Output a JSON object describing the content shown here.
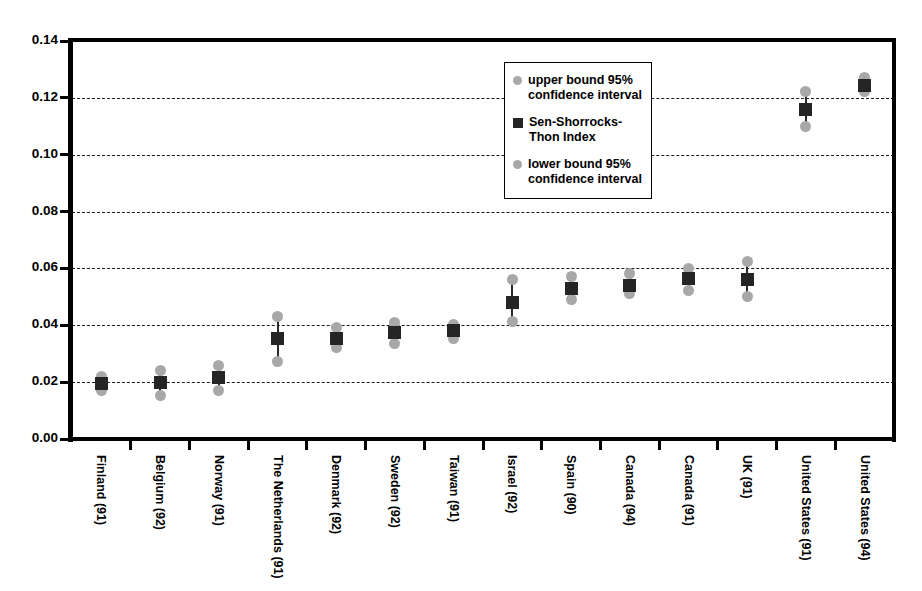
{
  "chart_data": {
    "type": "scatter",
    "title": "",
    "subtitle": "",
    "xlabel": "",
    "ylabel": "",
    "ylim": [
      0.0,
      0.14
    ],
    "ytick_labels": [
      "0.00",
      "0.02",
      "0.04",
      "0.06",
      "0.08",
      "0.10",
      "0.12",
      "0.14"
    ],
    "ytick_values": [
      0.0,
      0.02,
      0.04,
      0.06,
      0.08,
      0.1,
      0.12,
      0.14
    ],
    "grid": true,
    "grid_style": "dashed-horizontal",
    "legend_position": "inside-upper-center",
    "categories": [
      "Finland (91)",
      "Belgium (92)",
      "Norway (91)",
      "The Netherlands (91)",
      "Denmark (92)",
      "Sweden (92)",
      "Taiwan (91)",
      "Israel (92)",
      "Spain (90)",
      "Canada (94)",
      "Canada (91)",
      "UK (91)",
      "United States (91)",
      "United States (94)"
    ],
    "series": [
      {
        "name": "upper bound 95% confidence interval",
        "marker": "circle",
        "color": "#a8a8a8",
        "values": [
          0.022,
          0.024,
          0.026,
          0.0432,
          0.0392,
          0.041,
          0.0402,
          0.056,
          0.0572,
          0.0582,
          0.06,
          0.0625,
          0.1222,
          0.1272
        ]
      },
      {
        "name": "Sen-Shorrocks-Thon Index",
        "marker": "square",
        "color": "#252525",
        "values": [
          0.0195,
          0.0197,
          0.0215,
          0.0355,
          0.0355,
          0.0375,
          0.038,
          0.048,
          0.0528,
          0.054,
          0.0565,
          0.056,
          0.116,
          0.1245
        ]
      },
      {
        "name": "lower bound 95% confidence interval",
        "marker": "circle",
        "color": "#a8a8a8",
        "values": [
          0.0172,
          0.0152,
          0.017,
          0.0272,
          0.0322,
          0.0335,
          0.0352,
          0.0412,
          0.049,
          0.0512,
          0.0522,
          0.05,
          0.11,
          0.1222
        ]
      }
    ]
  },
  "legend": {
    "items": [
      {
        "label": "upper bound 95% confidence interval",
        "marker": "circle",
        "color": "#a8a8a8"
      },
      {
        "label": "Sen-Shorrocks-Thon Index",
        "marker": "square",
        "color": "#252525"
      },
      {
        "label": "lower bound 95% confidence interval",
        "marker": "circle",
        "color": "#a8a8a8"
      }
    ]
  },
  "colors": {
    "bound_marker": "#a8a8a8",
    "index_marker": "#252525",
    "axis": "#000000",
    "gridline": "#1a1a1a",
    "background": "#ffffff"
  }
}
